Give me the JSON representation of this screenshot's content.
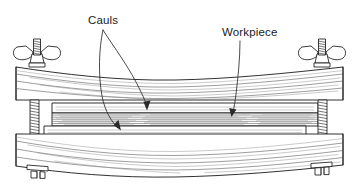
{
  "diagram": {
    "background_color": "#ffffff",
    "line_color": "#1a1a1a",
    "grain_color": "#5d5d5d",
    "text_color": "#1a1a1a",
    "width": 359,
    "height": 186
  },
  "labels": {
    "cauls": {
      "text": "Cauls",
      "x": 88,
      "y": 24
    },
    "workpiece": {
      "text": "Workpiece",
      "x": 222,
      "y": 36
    }
  },
  "parts": {
    "top_beam": {
      "name": "top curved clamping beam",
      "icon": "wood-beam-icon"
    },
    "bottom_beam": {
      "name": "bottom curved clamping beam",
      "icon": "wood-beam-icon"
    },
    "top_caul": {
      "name": "upper caul strip",
      "icon": "caul-strip-icon"
    },
    "bottom_caul": {
      "name": "lower caul strip",
      "icon": "caul-strip-icon"
    },
    "workpiece_stack": {
      "name": "laminated workpiece",
      "icon": "lamination-stack-icon",
      "lamination_count": 7
    },
    "left_wing_nut": {
      "name": "left wing nut",
      "icon": "wing-nut-icon"
    },
    "right_wing_nut": {
      "name": "right wing nut",
      "icon": "wing-nut-icon"
    },
    "left_threaded_rod": {
      "name": "left threaded rod",
      "icon": "threaded-rod-icon"
    },
    "right_threaded_rod": {
      "name": "right threaded rod",
      "icon": "threaded-rod-icon"
    },
    "left_foot_nut": {
      "name": "left bottom nut",
      "icon": "hex-nut-icon"
    },
    "right_foot_nut": {
      "name": "right bottom nut",
      "icon": "hex-nut-icon"
    }
  },
  "leaders": {
    "cauls_upper": {
      "name": "cauls leader to upper caul"
    },
    "cauls_lower": {
      "name": "cauls leader to lower caul"
    },
    "workpiece": {
      "name": "workpiece leader"
    }
  }
}
